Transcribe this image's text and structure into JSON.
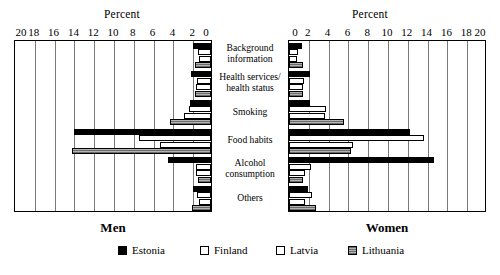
{
  "chart_data": {
    "type": "bar",
    "orientation": "horizontal",
    "layout": "butterfly/back-to-back paired panels",
    "title": "",
    "panels": [
      {
        "name": "Men",
        "title": "Men",
        "axis_title": "Percent",
        "direction": "right-to-left",
        "xlim": [
          0,
          20
        ],
        "ticks": [
          20,
          18,
          16,
          14,
          12,
          10,
          8,
          6,
          4,
          2,
          0
        ],
        "grid": true
      },
      {
        "name": "Women",
        "title": "Women",
        "axis_title": "Percent",
        "direction": "left-to-right",
        "xlim": [
          0,
          20
        ],
        "ticks": [
          0,
          2,
          4,
          6,
          8,
          10,
          12,
          14,
          16,
          18,
          20
        ],
        "grid": true
      }
    ],
    "categories": [
      "Background information",
      "Health services/ health status",
      "Smoking",
      "Food habits",
      "Alcohol consumption",
      "Others"
    ],
    "legend": {
      "position": "bottom",
      "entries": [
        "Estonia",
        "Finland",
        "Latvia",
        "Lithuania"
      ]
    },
    "series": [
      {
        "name": "Estonia",
        "fill": "solid-black",
        "men": [
          1.8,
          2.0,
          2.1,
          13.8,
          4.3,
          1.8
        ],
        "women": [
          1.3,
          2.1,
          2.1,
          12.2,
          14.6,
          1.9
        ]
      },
      {
        "name": "Finland",
        "fill": "white-outline",
        "men": [
          1.3,
          1.4,
          2.2,
          7.3,
          1.5,
          1.4
        ],
        "women": [
          0.9,
          1.5,
          3.7,
          13.6,
          2.2,
          2.3
        ]
      },
      {
        "name": "Latvia",
        "fill": "white-outline",
        "men": [
          1.2,
          1.5,
          2.7,
          5.2,
          1.5,
          1.2
        ],
        "women": [
          0.8,
          1.4,
          3.6,
          6.5,
          1.6,
          1.6
        ]
      },
      {
        "name": "Lithuania",
        "fill": "gray-hatched",
        "men": [
          1.6,
          1.6,
          4.1,
          14.0,
          1.3,
          1.9
        ],
        "women": [
          1.4,
          1.4,
          5.6,
          6.3,
          1.4,
          2.7
        ]
      }
    ]
  },
  "labels": {
    "percent_left": "Percent",
    "percent_right": "Percent"
  }
}
